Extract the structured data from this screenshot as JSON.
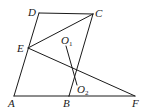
{
  "diagram": {
    "type": "geometry",
    "stroke_color": "#1a1a1a",
    "background": "#ffffff",
    "points": {
      "A": {
        "x": 14,
        "y": 96,
        "label": "A",
        "label_x": 8,
        "label_y": 107
      },
      "B": {
        "x": 69,
        "y": 96,
        "label": "B",
        "label_x": 63,
        "label_y": 107
      },
      "F": {
        "x": 135,
        "y": 96,
        "label": "F",
        "label_x": 132,
        "label_y": 107
      },
      "C": {
        "x": 93,
        "y": 14,
        "label": "C",
        "label_x": 95,
        "label_y": 17
      },
      "D": {
        "x": 39,
        "y": 13,
        "label": "D",
        "label_x": 28,
        "label_y": 16
      },
      "E": {
        "x": 28,
        "y": 48,
        "label": "E",
        "label_x": 17,
        "label_y": 52
      },
      "O1": {
        "x": 66,
        "y": 46,
        "label": "O",
        "sub": "1",
        "label_x": 61,
        "label_y": 44
      },
      "O2": {
        "x": 77,
        "y": 85,
        "label": "O",
        "sub": "2",
        "label_x": 77,
        "label_y": 93
      }
    },
    "segments": [
      [
        "A",
        "B"
      ],
      [
        "B",
        "F"
      ],
      [
        "A",
        "D"
      ],
      [
        "D",
        "C"
      ],
      [
        "C",
        "B"
      ],
      [
        "E",
        "C"
      ],
      [
        "E",
        "F"
      ],
      [
        "O1",
        "O2"
      ]
    ]
  }
}
